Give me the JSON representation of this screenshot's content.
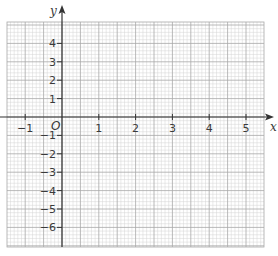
{
  "graph": {
    "x_axis_label": "x",
    "y_axis_label": "y",
    "origin_label": "O",
    "x_range": [
      -1.5,
      5.5
    ],
    "y_range": [
      -6.8,
      5.0
    ],
    "x_tick_labels": [
      {
        "value": -1,
        "text": "−1"
      },
      {
        "value": 1,
        "text": "1"
      },
      {
        "value": 2,
        "text": "2"
      },
      {
        "value": 3,
        "text": "3"
      },
      {
        "value": 4,
        "text": "4"
      },
      {
        "value": 5,
        "text": "5"
      }
    ],
    "y_tick_labels": [
      {
        "value": 4,
        "text": "4"
      },
      {
        "value": 3,
        "text": "3"
      },
      {
        "value": 2,
        "text": "2"
      },
      {
        "value": 1,
        "text": "1"
      },
      {
        "value": -1,
        "text": "−1"
      },
      {
        "value": -2,
        "text": "−2"
      },
      {
        "value": -3,
        "text": "−3"
      },
      {
        "value": -4,
        "text": "−4"
      },
      {
        "value": -5,
        "text": "−5"
      },
      {
        "value": -6,
        "text": "−6"
      }
    ],
    "colors": {
      "minor_grid": "#d4d4d4",
      "major_grid": "#a8a8a8",
      "axis": "#333333",
      "text": "#3a3a3a"
    }
  }
}
